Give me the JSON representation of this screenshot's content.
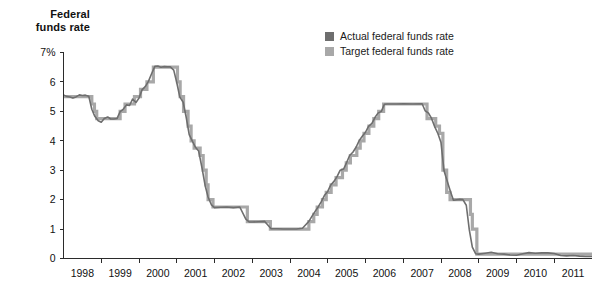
{
  "chart_data": {
    "type": "line",
    "title": "Federal funds rate",
    "xlabel": "",
    "ylabel": "Federal funds rate",
    "ylim": [
      0,
      7
    ],
    "xlim": [
      1998,
      2012
    ],
    "grid": false,
    "legend_position": "top-right",
    "y_ticks": [
      "7%",
      "6",
      "5",
      "4",
      "3",
      "2",
      "1",
      "0"
    ],
    "y_tick_values": [
      7,
      6,
      5,
      4,
      3,
      2,
      1,
      0
    ],
    "x_ticks": [
      "1998",
      "1999",
      "2000",
      "2001",
      "2002",
      "2003",
      "2004",
      "2005",
      "2006",
      "2007",
      "2008",
      "2009",
      "2010",
      "2011"
    ],
    "x_tick_values": [
      1998,
      1999,
      2000,
      2001,
      2002,
      2003,
      2004,
      2005,
      2006,
      2007,
      2008,
      2009,
      2010,
      2011
    ],
    "colors": {
      "actual": "#6e6e6e",
      "target": "#a8a8a8",
      "axis": "#2b2b2b",
      "text": "#111111",
      "background": "#ffffff"
    },
    "series": [
      {
        "name": "Actual federal funds rate",
        "color": "#6e6e6e",
        "points": [
          [
            1998.0,
            5.56
          ],
          [
            1998.08,
            5.51
          ],
          [
            1998.17,
            5.49
          ],
          [
            1998.25,
            5.45
          ],
          [
            1998.33,
            5.49
          ],
          [
            1998.42,
            5.56
          ],
          [
            1998.5,
            5.54
          ],
          [
            1998.58,
            5.55
          ],
          [
            1998.67,
            5.51
          ],
          [
            1998.75,
            5.07
          ],
          [
            1998.83,
            4.83
          ],
          [
            1998.92,
            4.68
          ],
          [
            1999.0,
            4.63
          ],
          [
            1999.08,
            4.76
          ],
          [
            1999.17,
            4.81
          ],
          [
            1999.25,
            4.74
          ],
          [
            1999.33,
            4.74
          ],
          [
            1999.42,
            4.76
          ],
          [
            1999.5,
            4.99
          ],
          [
            1999.58,
            5.07
          ],
          [
            1999.67,
            5.22
          ],
          [
            1999.75,
            5.2
          ],
          [
            1999.83,
            5.42
          ],
          [
            1999.92,
            5.3
          ],
          [
            2000.0,
            5.45
          ],
          [
            2000.08,
            5.73
          ],
          [
            2000.17,
            5.85
          ],
          [
            2000.25,
            6.02
          ],
          [
            2000.33,
            6.27
          ],
          [
            2000.42,
            6.53
          ],
          [
            2000.5,
            6.54
          ],
          [
            2000.58,
            6.5
          ],
          [
            2000.67,
            6.52
          ],
          [
            2000.75,
            6.51
          ],
          [
            2000.83,
            6.51
          ],
          [
            2000.92,
            6.4
          ],
          [
            2001.0,
            5.98
          ],
          [
            2001.08,
            5.49
          ],
          [
            2001.17,
            5.31
          ],
          [
            2001.25,
            4.8
          ],
          [
            2001.33,
            4.21
          ],
          [
            2001.42,
            3.97
          ],
          [
            2001.5,
            3.77
          ],
          [
            2001.58,
            3.65
          ],
          [
            2001.67,
            3.07
          ],
          [
            2001.75,
            2.49
          ],
          [
            2001.83,
            2.09
          ],
          [
            2001.92,
            1.82
          ],
          [
            2002.0,
            1.73
          ],
          [
            2002.17,
            1.74
          ],
          [
            2002.33,
            1.75
          ],
          [
            2002.5,
            1.73
          ],
          [
            2002.67,
            1.75
          ],
          [
            2002.83,
            1.34
          ],
          [
            2002.92,
            1.24
          ],
          [
            2003.0,
            1.24
          ],
          [
            2003.17,
            1.25
          ],
          [
            2003.33,
            1.26
          ],
          [
            2003.5,
            1.01
          ],
          [
            2003.67,
            1.01
          ],
          [
            2003.83,
            1.0
          ],
          [
            2004.0,
            1.0
          ],
          [
            2004.17,
            1.0
          ],
          [
            2004.33,
            1.03
          ],
          [
            2004.5,
            1.26
          ],
          [
            2004.58,
            1.43
          ],
          [
            2004.67,
            1.61
          ],
          [
            2004.75,
            1.76
          ],
          [
            2004.83,
            1.93
          ],
          [
            2004.92,
            2.16
          ],
          [
            2005.0,
            2.28
          ],
          [
            2005.08,
            2.5
          ],
          [
            2005.17,
            2.63
          ],
          [
            2005.25,
            2.79
          ],
          [
            2005.33,
            3.0
          ],
          [
            2005.42,
            3.04
          ],
          [
            2005.5,
            3.26
          ],
          [
            2005.58,
            3.5
          ],
          [
            2005.67,
            3.62
          ],
          [
            2005.75,
            3.78
          ],
          [
            2005.83,
            4.0
          ],
          [
            2005.92,
            4.16
          ],
          [
            2006.0,
            4.29
          ],
          [
            2006.08,
            4.49
          ],
          [
            2006.17,
            4.59
          ],
          [
            2006.25,
            4.79
          ],
          [
            2006.33,
            4.94
          ],
          [
            2006.42,
            5.0
          ],
          [
            2006.5,
            5.24
          ],
          [
            2006.58,
            5.25
          ],
          [
            2006.67,
            5.25
          ],
          [
            2006.83,
            5.25
          ],
          [
            2007.0,
            5.26
          ],
          [
            2007.25,
            5.25
          ],
          [
            2007.5,
            5.26
          ],
          [
            2007.58,
            5.02
          ],
          [
            2007.67,
            4.94
          ],
          [
            2007.75,
            4.76
          ],
          [
            2007.83,
            4.49
          ],
          [
            2007.92,
            4.24
          ],
          [
            2008.0,
            3.94
          ],
          [
            2008.08,
            2.98
          ],
          [
            2008.17,
            2.61
          ],
          [
            2008.25,
            2.28
          ],
          [
            2008.33,
            1.98
          ],
          [
            2008.5,
            2.01
          ],
          [
            2008.58,
            2.0
          ],
          [
            2008.67,
            1.81
          ],
          [
            2008.75,
            0.97
          ],
          [
            2008.83,
            0.39
          ],
          [
            2008.92,
            0.16
          ],
          [
            2009.0,
            0.15
          ],
          [
            2009.17,
            0.18
          ],
          [
            2009.33,
            0.21
          ],
          [
            2009.5,
            0.16
          ],
          [
            2009.67,
            0.15
          ],
          [
            2009.83,
            0.12
          ],
          [
            2010.0,
            0.11
          ],
          [
            2010.17,
            0.16
          ],
          [
            2010.33,
            0.2
          ],
          [
            2010.5,
            0.18
          ],
          [
            2010.67,
            0.19
          ],
          [
            2010.83,
            0.19
          ],
          [
            2011.0,
            0.17
          ],
          [
            2011.17,
            0.1
          ],
          [
            2011.33,
            0.09
          ],
          [
            2011.5,
            0.1
          ],
          [
            2011.67,
            0.08
          ],
          [
            2011.83,
            0.07
          ],
          [
            2012.0,
            0.07
          ]
        ]
      },
      {
        "name": "Target federal funds rate",
        "color": "#a8a8a8",
        "points": [
          [
            1998.0,
            5.5
          ],
          [
            1998.73,
            5.5
          ],
          [
            1998.75,
            5.25
          ],
          [
            1998.82,
            5.0
          ],
          [
            1998.88,
            4.75
          ],
          [
            1999.48,
            4.75
          ],
          [
            1999.5,
            5.0
          ],
          [
            1999.63,
            5.25
          ],
          [
            1999.88,
            5.5
          ],
          [
            2000.04,
            5.75
          ],
          [
            2000.21,
            6.0
          ],
          [
            2000.38,
            6.5
          ],
          [
            2001.0,
            6.5
          ],
          [
            2001.02,
            6.0
          ],
          [
            2001.09,
            5.5
          ],
          [
            2001.18,
            5.0
          ],
          [
            2001.3,
            4.5
          ],
          [
            2001.38,
            4.0
          ],
          [
            2001.46,
            3.75
          ],
          [
            2001.62,
            3.5
          ],
          [
            2001.7,
            3.0
          ],
          [
            2001.78,
            2.5
          ],
          [
            2001.83,
            2.0
          ],
          [
            2001.96,
            1.75
          ],
          [
            2002.87,
            1.25
          ],
          [
            2003.48,
            1.0
          ],
          [
            2004.49,
            1.0
          ],
          [
            2004.5,
            1.25
          ],
          [
            2004.63,
            1.5
          ],
          [
            2004.72,
            1.75
          ],
          [
            2004.86,
            2.0
          ],
          [
            2004.96,
            2.25
          ],
          [
            2005.09,
            2.5
          ],
          [
            2005.22,
            2.75
          ],
          [
            2005.39,
            3.0
          ],
          [
            2005.49,
            3.25
          ],
          [
            2005.6,
            3.5
          ],
          [
            2005.77,
            3.75
          ],
          [
            2005.86,
            4.0
          ],
          [
            2005.96,
            4.25
          ],
          [
            2006.09,
            4.5
          ],
          [
            2006.22,
            4.75
          ],
          [
            2006.35,
            5.0
          ],
          [
            2006.48,
            5.25
          ],
          [
            2007.62,
            5.25
          ],
          [
            2007.63,
            4.75
          ],
          [
            2007.86,
            4.5
          ],
          [
            2007.96,
            4.25
          ],
          [
            2008.05,
            3.0
          ],
          [
            2008.15,
            2.25
          ],
          [
            2008.24,
            2.0
          ],
          [
            2008.73,
            2.0
          ],
          [
            2008.78,
            1.5
          ],
          [
            2008.83,
            1.0
          ],
          [
            2008.95,
            0.15
          ],
          [
            2012.0,
            0.15
          ]
        ]
      }
    ],
    "annotations": []
  },
  "legend": {
    "items": [
      {
        "label": "Actual federal funds rate",
        "color": "#6e6e6e"
      },
      {
        "label": "Target federal funds rate",
        "color": "#a8a8a8"
      }
    ]
  },
  "axis_title": {
    "line1": "Federal",
    "line2": "funds rate"
  }
}
